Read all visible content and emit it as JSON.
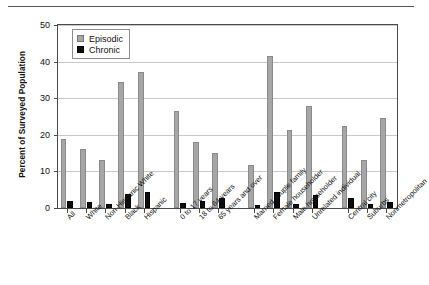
{
  "chart_data": {
    "type": "bar",
    "title": "",
    "xlabel": "",
    "ylabel": "Percent of Surveyed Population",
    "ylim": [
      0,
      50
    ],
    "yticks": [
      0,
      10,
      20,
      30,
      40,
      50
    ],
    "grid": true,
    "legend_position": "top-left",
    "categories": [
      "All",
      "White",
      "Non-Hispanic White",
      "Black",
      "Hispanic",
      "0 to 17 years",
      "18 to 64 years",
      "65 years and over",
      "Married couple family",
      "Female householder",
      "Male householder",
      "Unrelated individual",
      "Central city",
      "Suburbs",
      "Nonmetropolitan"
    ],
    "group_breaks": [
      5,
      8,
      12
    ],
    "series": [
      {
        "name": "Episodic",
        "color": "#a6a6a6",
        "values": [
          18.9,
          16.1,
          13.1,
          34.4,
          37.1,
          26.5,
          18.0,
          15.0,
          11.8,
          41.4,
          21.4,
          27.9,
          22.4,
          13.0,
          24.6
        ]
      },
      {
        "name": "Chronic",
        "color": "#0d0d0d",
        "values": [
          1.9,
          1.6,
          1.1,
          3.9,
          4.4,
          1.4,
          2.0,
          2.6,
          0.9,
          4.4,
          1.2,
          3.6,
          2.8,
          1.2,
          1.7
        ]
      }
    ]
  },
  "legend": {
    "episodic_label": "Episodic",
    "chronic_label": "Chronic"
  },
  "axis": {
    "y_title": "Percent of Surveyed Population",
    "y_tick_labels": [
      "50",
      "40",
      "30",
      "20",
      "10",
      "0"
    ]
  }
}
